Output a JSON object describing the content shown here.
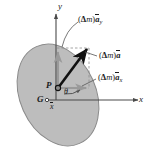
{
  "figure": {
    "background_color": "#ffffff",
    "body_fill_color": "#bdbdbd",
    "body_stroke_color": "#8a8a8a",
    "vector_color": "#111111",
    "component_color": "#9a9a9a",
    "axis_color": "#4a4a4a"
  },
  "axes": {
    "x_label": "x",
    "y_label": "y",
    "origin_label": "G"
  },
  "points": {
    "p_label": "P",
    "g_label": "G"
  },
  "dimensions": {
    "x_bar_label": "x",
    "theta_label": "θ"
  },
  "vectors": [
    {
      "name": "acceleration-y-component",
      "paren_open": "(",
      "delta": "Δ",
      "m": "m",
      "paren_close": ")",
      "a": "a",
      "subscript": "y",
      "full_label": "(Δm)ā_y"
    },
    {
      "name": "acceleration-resultant",
      "paren_open": "(",
      "delta": "Δ",
      "m": "m",
      "paren_close": ")",
      "a": "a",
      "subscript": "",
      "full_label": "(Δm)ā"
    },
    {
      "name": "acceleration-x-component",
      "paren_open": "(",
      "delta": "Δ",
      "m": "m",
      "paren_close": ")",
      "a": "a",
      "subscript": "x",
      "full_label": "(Δm)ā_x"
    }
  ]
}
